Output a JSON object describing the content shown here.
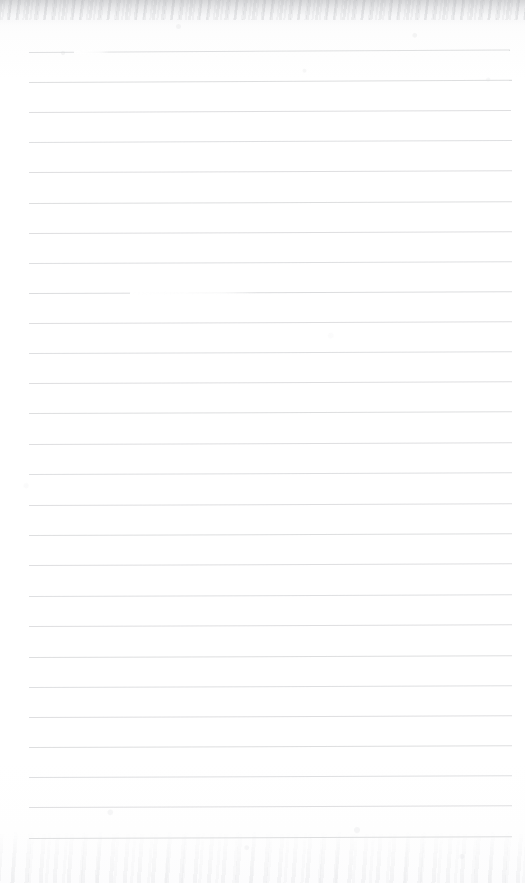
{
  "document": {
    "kind": "scanned-lined-notebook-page",
    "title": "Blank ruled notebook page",
    "content_text": "",
    "width_px": 525,
    "height_px": 883
  },
  "paper": {
    "background_color": "#fefefe",
    "edge_shade_color": "#92949a",
    "texture": "scanner-grain"
  },
  "ruling": {
    "line_color": "#d9dadc",
    "line_thickness_px": 1,
    "line_spacing_px": 30.2,
    "first_line_y_px": 52,
    "last_line_y_px": 838,
    "line_count": 27,
    "left_margin_px": 29,
    "right_margin_px": 512,
    "skew_deg": -0.22,
    "lines": [
      {
        "y": 52,
        "x1": 29,
        "x2": 510,
        "skew": -0.3,
        "opacity": 0.85,
        "gaps": [
          {
            "x": 74,
            "w": 36,
            "soft": true
          }
        ]
      },
      {
        "y": 82,
        "x1": 29,
        "x2": 512,
        "skew": -0.26,
        "opacity": 0.9,
        "gaps": []
      },
      {
        "y": 112,
        "x1": 29,
        "x2": 511,
        "skew": -0.24,
        "opacity": 0.88,
        "gaps": []
      },
      {
        "y": 142,
        "x1": 29,
        "x2": 512,
        "skew": -0.24,
        "opacity": 0.86,
        "gaps": []
      },
      {
        "y": 172,
        "x1": 29,
        "x2": 512,
        "skew": -0.22,
        "opacity": 0.88,
        "gaps": []
      },
      {
        "y": 203,
        "x1": 29,
        "x2": 512,
        "skew": -0.22,
        "opacity": 0.9,
        "gaps": []
      },
      {
        "y": 233,
        "x1": 29,
        "x2": 512,
        "skew": -0.22,
        "opacity": 0.88,
        "gaps": []
      },
      {
        "y": 263,
        "x1": 29,
        "x2": 512,
        "skew": -0.22,
        "opacity": 0.86,
        "gaps": []
      },
      {
        "y": 293,
        "x1": 29,
        "x2": 512,
        "skew": -0.2,
        "opacity": 0.92,
        "gaps": [
          {
            "x": 130,
            "w": 128,
            "soft": true
          }
        ]
      },
      {
        "y": 323,
        "x1": 29,
        "x2": 512,
        "skew": -0.22,
        "opacity": 0.88,
        "gaps": []
      },
      {
        "y": 353,
        "x1": 29,
        "x2": 512,
        "skew": -0.22,
        "opacity": 0.86,
        "gaps": []
      },
      {
        "y": 383,
        "x1": 29,
        "x2": 512,
        "skew": -0.22,
        "opacity": 0.88,
        "gaps": []
      },
      {
        "y": 413,
        "x1": 29,
        "x2": 512,
        "skew": -0.22,
        "opacity": 0.9,
        "gaps": []
      },
      {
        "y": 444,
        "x1": 29,
        "x2": 512,
        "skew": -0.22,
        "opacity": 0.88,
        "gaps": []
      },
      {
        "y": 474,
        "x1": 29,
        "x2": 512,
        "skew": -0.22,
        "opacity": 0.86,
        "gaps": []
      },
      {
        "y": 505,
        "x1": 29,
        "x2": 512,
        "skew": -0.22,
        "opacity": 0.88,
        "gaps": []
      },
      {
        "y": 535,
        "x1": 29,
        "x2": 512,
        "skew": -0.22,
        "opacity": 0.9,
        "gaps": []
      },
      {
        "y": 565,
        "x1": 29,
        "x2": 512,
        "skew": -0.22,
        "opacity": 0.88,
        "gaps": []
      },
      {
        "y": 596,
        "x1": 29,
        "x2": 512,
        "skew": -0.22,
        "opacity": 0.86,
        "gaps": []
      },
      {
        "y": 626,
        "x1": 29,
        "x2": 512,
        "skew": -0.22,
        "opacity": 0.88,
        "gaps": []
      },
      {
        "y": 657,
        "x1": 29,
        "x2": 512,
        "skew": -0.22,
        "opacity": 0.9,
        "gaps": []
      },
      {
        "y": 687,
        "x1": 29,
        "x2": 512,
        "skew": -0.22,
        "opacity": 0.86,
        "gaps": []
      },
      {
        "y": 717,
        "x1": 29,
        "x2": 512,
        "skew": -0.22,
        "opacity": 0.88,
        "gaps": []
      },
      {
        "y": 747,
        "x1": 29,
        "x2": 512,
        "skew": -0.22,
        "opacity": 0.9,
        "gaps": []
      },
      {
        "y": 777,
        "x1": 29,
        "x2": 512,
        "skew": -0.22,
        "opacity": 0.86,
        "gaps": []
      },
      {
        "y": 807,
        "x1": 29,
        "x2": 512,
        "skew": -0.22,
        "opacity": 0.88,
        "gaps": []
      },
      {
        "y": 838,
        "x1": 29,
        "x2": 512,
        "skew": -0.22,
        "opacity": 0.9,
        "gaps": []
      }
    ]
  }
}
